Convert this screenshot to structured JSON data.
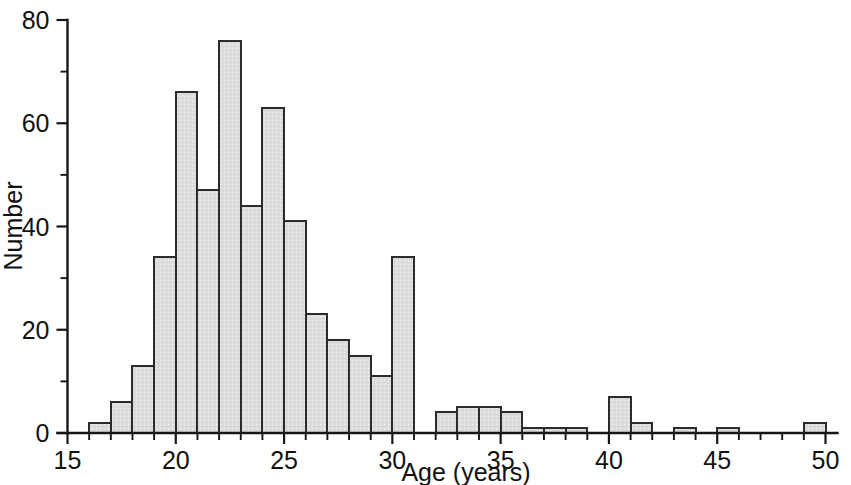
{
  "chart_data": {
    "type": "bar",
    "title": "",
    "subtitle": "",
    "xlabel": "Age (years)",
    "ylabel": "Number",
    "xlim": [
      15,
      50
    ],
    "ylim": [
      0,
      80
    ],
    "grid": false,
    "legend": null,
    "bin_width": 1,
    "x_ticks_major": [
      15,
      20,
      25,
      30,
      35,
      40,
      45,
      50
    ],
    "x_tick_labels": [
      "15",
      "20",
      "25",
      "30",
      "35",
      "40",
      "45",
      "50"
    ],
    "x_ticks_minor": [
      16,
      17,
      18,
      19,
      21,
      22,
      23,
      24,
      26,
      27,
      28,
      29,
      31,
      32,
      33,
      34,
      36,
      37,
      38,
      39,
      41,
      42,
      43,
      44,
      46,
      47,
      48,
      49
    ],
    "y_ticks_major": [
      0,
      20,
      40,
      60,
      80
    ],
    "y_tick_labels": [
      "0",
      "20",
      "40",
      "60",
      "80"
    ],
    "y_ticks_minor": [
      10,
      30,
      50,
      70
    ],
    "bar_fill_color": "#dcdcdc",
    "bar_edge_color": "#2b2b2b",
    "axis_color": "#161616",
    "background_color": "#ffffff",
    "bins": [
      {
        "x0": 15,
        "x1": 16,
        "value": 0
      },
      {
        "x0": 16,
        "x1": 17,
        "value": 2
      },
      {
        "x0": 17,
        "x1": 18,
        "value": 6
      },
      {
        "x0": 18,
        "x1": 19,
        "value": 13
      },
      {
        "x0": 19,
        "x1": 20,
        "value": 34
      },
      {
        "x0": 20,
        "x1": 21,
        "value": 66
      },
      {
        "x0": 21,
        "x1": 22,
        "value": 47
      },
      {
        "x0": 22,
        "x1": 23,
        "value": 76
      },
      {
        "x0": 23,
        "x1": 24,
        "value": 44
      },
      {
        "x0": 24,
        "x1": 25,
        "value": 63
      },
      {
        "x0": 25,
        "x1": 26,
        "value": 41
      },
      {
        "x0": 26,
        "x1": 27,
        "value": 23
      },
      {
        "x0": 27,
        "x1": 28,
        "value": 18
      },
      {
        "x0": 28,
        "x1": 29,
        "value": 15
      },
      {
        "x0": 29,
        "x1": 30,
        "value": 11
      },
      {
        "x0": 30,
        "x1": 31,
        "value": 34
      },
      {
        "x0": 31,
        "x1": 32,
        "value": 0
      },
      {
        "x0": 32,
        "x1": 33,
        "value": 4
      },
      {
        "x0": 33,
        "x1": 34,
        "value": 5
      },
      {
        "x0": 34,
        "x1": 35,
        "value": 5
      },
      {
        "x0": 35,
        "x1": 36,
        "value": 4
      },
      {
        "x0": 36,
        "x1": 37,
        "value": 1
      },
      {
        "x0": 37,
        "x1": 38,
        "value": 1
      },
      {
        "x0": 38,
        "x1": 39,
        "value": 1
      },
      {
        "x0": 39,
        "x1": 40,
        "value": 0
      },
      {
        "x0": 40,
        "x1": 41,
        "value": 7
      },
      {
        "x0": 41,
        "x1": 42,
        "value": 2
      },
      {
        "x0": 42,
        "x1": 43,
        "value": 0
      },
      {
        "x0": 43,
        "x1": 44,
        "value": 1
      },
      {
        "x0": 44,
        "x1": 45,
        "value": 0
      },
      {
        "x0": 45,
        "x1": 46,
        "value": 1
      },
      {
        "x0": 46,
        "x1": 47,
        "value": 0
      },
      {
        "x0": 47,
        "x1": 48,
        "value": 0
      },
      {
        "x0": 48,
        "x1": 49,
        "value": 0
      },
      {
        "x0": 49,
        "x1": 50,
        "value": 2
      }
    ]
  }
}
